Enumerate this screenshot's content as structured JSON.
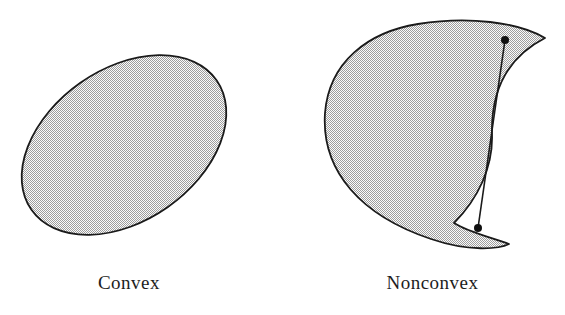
{
  "figure": {
    "title": "",
    "background_color": "#ffffff",
    "outline_color": "#1a1a1a",
    "fill_color": "#c9c9c9",
    "fill_pattern": "halftone-dither-checkerboard",
    "panels": [
      {
        "id": "convex-panel",
        "caption": "Convex",
        "shape_name": "ellipse",
        "shape_kind": "convex-set",
        "description": "Tilted filled ellipse",
        "geometry": {
          "center_x": 124,
          "center_y": 145,
          "radius_x": 113,
          "radius_y": 76,
          "rotation_deg": -35
        },
        "markers": []
      },
      {
        "id": "nonconvex-panel",
        "caption": "Nonconvex",
        "shape_name": "crescent",
        "shape_kind": "nonconvex-set",
        "description": "Crescent / kidney shape with a chord whose interior leaves the set",
        "geometry": {
          "outer_path": "M 545 38 C 520 22 470 17 420 24 C 370 31 330 60 325 112 C 320 170 360 215 430 238 C 470 250 500 248 508 243 C 494 238 470 233 455 224 C 478 200 492 168 491 136 C 490 100 500 60 545 38 Z",
          "inner_notch_path": "M 545 38 C 505 62 492 100 493 136 C 494 170 480 204 455 224",
          "left_extent_x": 325,
          "right_extent_x": 545,
          "top_extent_y": 22,
          "bottom_extent_y": 248
        },
        "markers": [
          {
            "name": "point-a",
            "x": 505,
            "y": 40,
            "radius": 4
          },
          {
            "name": "point-b",
            "x": 478,
            "y": 228,
            "radius": 4
          }
        ],
        "segment": {
          "name": "chord-ab",
          "x1": 505,
          "y1": 40,
          "x2": 478,
          "y2": 228,
          "stroke_width": 1.6
        }
      }
    ]
  }
}
